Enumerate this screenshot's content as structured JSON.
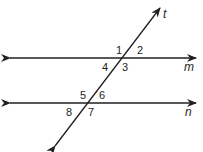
{
  "diagram": {
    "type": "parallel-lines-transversal",
    "line_color": "#231f20",
    "lines": {
      "m": {
        "label": "m",
        "x1": 10,
        "y": 58,
        "x2": 196
      },
      "n": {
        "label": "n",
        "x1": 10,
        "y": 103,
        "x2": 196
      },
      "t": {
        "label": "t",
        "x1": 55,
        "y1": 146,
        "x2": 160,
        "y2": 8
      }
    },
    "angles": [
      {
        "num": "1",
        "x": 116,
        "y": 52
      },
      {
        "num": "2",
        "x": 137,
        "y": 52
      },
      {
        "num": "3",
        "x": 123,
        "y": 72
      },
      {
        "num": "4",
        "x": 102,
        "y": 72
      },
      {
        "num": "5",
        "x": 80,
        "y": 97
      },
      {
        "num": "6",
        "x": 99,
        "y": 97
      },
      {
        "num": "7",
        "x": 88,
        "y": 117
      },
      {
        "num": "8",
        "x": 66,
        "y": 117
      }
    ]
  }
}
